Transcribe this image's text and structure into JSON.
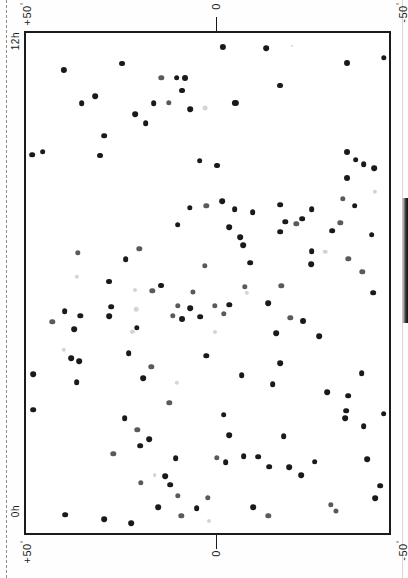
{
  "document": {
    "type": "scanned-figure-page",
    "caption_fragment": "",
    "orientation": "rotated-90"
  },
  "axes": {
    "top_left_label": "+50",
    "top_left_corner_label": "12h",
    "top_center_label": "0",
    "top_right_label": "-50",
    "bottom_left_corner_label": "0h",
    "bottom_left_label": "+50",
    "bottom_center_label": "0",
    "bottom_right_label": "-50",
    "degree_symbol": "°"
  },
  "colors": {
    "frame": "#1b1b1b",
    "point_dark": "#1a1a1a",
    "point_mid": "#5a5a5a",
    "point_light": "#a8a8a8",
    "point_faint": "#d4d4d4",
    "margin_rule": "#8f8f8f",
    "background": "#ffffff"
  },
  "chart_data": {
    "type": "scatter",
    "title": "",
    "xlabel": "Right Ascension",
    "ylabel": "Declination",
    "xlim": [
      0,
      1
    ],
    "ylim": [
      0,
      1
    ],
    "grid": false,
    "legend": null,
    "note": "Sky-distribution scatter plot; page printed rotated 90 degrees. Axis ticks marked at 0 (top and bottom centre); corner labels 12h / 0h and +50/-50 degrees.",
    "x_axis_ticks": [
      "+50",
      "0",
      "-50"
    ],
    "y_axis_ticks": [
      "12h",
      "0h"
    ],
    "point_count": 151,
    "points": [
      [
        0.543,
        0.028,
        "dark",
        4.6
      ],
      [
        0.662,
        0.03,
        "dark",
        4.2
      ],
      [
        0.733,
        0.026,
        "faint",
        1.6
      ],
      [
        0.105,
        0.073,
        "dark",
        4.6
      ],
      [
        0.885,
        0.06,
        "dark",
        4.4
      ],
      [
        0.985,
        0.05,
        "dark",
        4.0
      ],
      [
        0.265,
        0.061,
        "dark",
        4.4
      ],
      [
        0.415,
        0.089,
        "dark",
        4.2
      ],
      [
        0.373,
        0.09,
        "mid",
        4.0
      ],
      [
        0.437,
        0.09,
        "dark",
        4.4
      ],
      [
        0.43,
        0.115,
        "dark",
        4.4
      ],
      [
        0.7,
        0.105,
        "dark",
        4.4
      ],
      [
        0.19,
        0.126,
        "dark",
        4.2
      ],
      [
        0.153,
        0.141,
        "dark",
        4.2
      ],
      [
        0.352,
        0.14,
        "dark",
        4.2
      ],
      [
        0.393,
        0.139,
        "mid",
        4.0
      ],
      [
        0.452,
        0.152,
        "dark",
        4.2
      ],
      [
        0.493,
        0.15,
        "faint",
        3.6
      ],
      [
        0.577,
        0.139,
        "dark",
        4.6
      ],
      [
        0.3,
        0.163,
        "dark",
        4.2
      ],
      [
        0.33,
        0.18,
        "dark",
        4.2
      ],
      [
        0.215,
        0.205,
        "dark",
        4.2
      ],
      [
        0.017,
        0.243,
        "dark",
        4.2
      ],
      [
        0.046,
        0.237,
        "dark",
        4.2
      ],
      [
        0.205,
        0.245,
        "dark",
        4.4
      ],
      [
        0.885,
        0.238,
        "dark",
        4.4
      ],
      [
        0.93,
        0.262,
        "dark",
        4.2
      ],
      [
        0.908,
        0.253,
        "dark",
        4.2
      ],
      [
        0.96,
        0.27,
        "dark",
        4.2
      ],
      [
        0.478,
        0.255,
        "dark",
        4.2
      ],
      [
        0.525,
        0.265,
        "dark",
        4.4
      ],
      [
        0.885,
        0.29,
        "dark",
        4.4
      ],
      [
        0.497,
        0.345,
        "mid",
        4.0
      ],
      [
        0.541,
        0.336,
        "dark",
        4.2
      ],
      [
        0.452,
        0.35,
        "dark",
        4.0
      ],
      [
        0.575,
        0.352,
        "dark",
        4.2
      ],
      [
        0.624,
        0.358,
        "dark",
        4.2
      ],
      [
        0.7,
        0.343,
        "dark",
        4.2
      ],
      [
        0.787,
        0.352,
        "dark",
        4.2
      ],
      [
        0.872,
        0.331,
        "mid",
        4.0
      ],
      [
        0.905,
        0.345,
        "dark",
        4.2
      ],
      [
        0.961,
        0.318,
        "faint",
        3.2
      ],
      [
        0.418,
        0.383,
        "dark",
        4.2
      ],
      [
        0.56,
        0.388,
        "dark",
        4.2
      ],
      [
        0.714,
        0.378,
        "dark",
        4.0
      ],
      [
        0.745,
        0.382,
        "mid",
        4.0
      ],
      [
        0.7,
        0.397,
        "dark",
        4.2
      ],
      [
        0.76,
        0.371,
        "dark",
        4.2
      ],
      [
        0.866,
        0.379,
        "mid",
        4.0
      ],
      [
        0.59,
        0.408,
        "dark",
        4.2
      ],
      [
        0.598,
        0.424,
        "dark",
        4.2
      ],
      [
        0.952,
        0.403,
        "dark",
        4.2
      ],
      [
        0.843,
        0.395,
        "dark",
        4.2
      ],
      [
        0.143,
        0.439,
        "mid",
        4.0
      ],
      [
        0.275,
        0.452,
        "dark",
        4.2
      ],
      [
        0.312,
        0.432,
        "mid",
        4.0
      ],
      [
        0.787,
        0.436,
        "dark",
        4.2
      ],
      [
        0.824,
        0.437,
        "faint",
        3.4
      ],
      [
        0.618,
        0.459,
        "dark",
        4.2
      ],
      [
        0.492,
        0.466,
        "mid",
        4.0
      ],
      [
        0.785,
        0.462,
        "dark",
        4.2
      ],
      [
        0.888,
        0.452,
        "mid",
        4.0
      ],
      [
        0.14,
        0.488,
        "faint",
        3.2
      ],
      [
        0.23,
        0.497,
        "dark",
        4.4
      ],
      [
        0.926,
        0.478,
        "mid",
        4.0
      ],
      [
        0.372,
        0.505,
        "dark",
        4.4
      ],
      [
        0.348,
        0.516,
        "mid",
        4.0
      ],
      [
        0.46,
        0.517,
        "mid",
        3.8
      ],
      [
        0.3,
        0.514,
        "faint",
        3.0
      ],
      [
        0.603,
        0.508,
        "mid",
        4.0
      ],
      [
        0.608,
        0.52,
        "faint",
        3.2
      ],
      [
        0.703,
        0.506,
        "mid",
        4.0
      ],
      [
        0.957,
        0.519,
        "dark",
        4.2
      ],
      [
        0.235,
        0.547,
        "dark",
        4.2
      ],
      [
        0.303,
        0.552,
        "faint",
        3.4
      ],
      [
        0.418,
        0.545,
        "mid",
        4.0
      ],
      [
        0.452,
        0.55,
        "dark",
        4.2
      ],
      [
        0.52,
        0.545,
        "mid",
        4.0
      ],
      [
        0.56,
        0.543,
        "dark",
        4.0
      ],
      [
        0.668,
        0.54,
        "dark",
        4.2
      ],
      [
        0.23,
        0.566,
        "dark",
        4.2
      ],
      [
        0.15,
        0.565,
        "dark",
        4.0
      ],
      [
        0.405,
        0.565,
        "mid",
        4.0
      ],
      [
        0.43,
        0.572,
        "dark",
        4.4
      ],
      [
        0.48,
        0.567,
        "dark",
        4.2
      ],
      [
        0.545,
        0.562,
        "mid",
        4.0
      ],
      [
        0.728,
        0.57,
        "mid",
        4.0
      ],
      [
        0.762,
        0.576,
        "dark",
        4.4
      ],
      [
        0.107,
        0.556,
        "dark",
        4.2
      ],
      [
        0.305,
        0.59,
        "dark",
        4.0
      ],
      [
        0.293,
        0.597,
        "faint",
        3.2
      ],
      [
        0.52,
        0.598,
        "faint",
        3.0
      ],
      [
        0.69,
        0.6,
        "dark",
        4.2
      ],
      [
        0.808,
        0.606,
        "dark",
        4.2
      ],
      [
        0.072,
        0.578,
        "mid",
        4.0
      ],
      [
        0.133,
        0.592,
        "dark",
        4.2
      ],
      [
        0.105,
        0.633,
        "faint",
        3.2
      ],
      [
        0.124,
        0.65,
        "dark",
        4.2
      ],
      [
        0.147,
        0.656,
        "dark",
        4.2
      ],
      [
        0.283,
        0.64,
        "dark",
        4.2
      ],
      [
        0.497,
        0.646,
        "dark",
        4.0
      ],
      [
        0.345,
        0.668,
        "mid",
        4.0
      ],
      [
        0.7,
        0.66,
        "dark",
        4.2
      ],
      [
        0.02,
        0.682,
        "dark",
        4.2
      ],
      [
        0.14,
        0.698,
        "dark",
        4.2
      ],
      [
        0.322,
        0.69,
        "dark",
        4.2
      ],
      [
        0.415,
        0.7,
        "faint",
        3.2
      ],
      [
        0.594,
        0.684,
        "dark",
        4.2
      ],
      [
        0.68,
        0.702,
        "dark",
        4.2
      ],
      [
        0.925,
        0.68,
        "dark",
        4.2
      ],
      [
        0.83,
        0.718,
        "dark",
        4.2
      ],
      [
        0.887,
        0.725,
        "dark",
        4.2
      ],
      [
        0.02,
        0.753,
        "dark",
        4.2
      ],
      [
        0.395,
        0.74,
        "mid",
        4.0
      ],
      [
        0.882,
        0.755,
        "dark",
        4.2
      ],
      [
        0.985,
        0.761,
        "dark",
        4.2
      ],
      [
        0.88,
        0.77,
        "dark",
        4.2
      ],
      [
        0.272,
        0.77,
        "dark",
        4.2
      ],
      [
        0.545,
        0.763,
        "dark",
        4.2
      ],
      [
        0.93,
        0.786,
        "dark",
        4.2
      ],
      [
        0.307,
        0.794,
        "mid",
        4.0
      ],
      [
        0.34,
        0.812,
        "dark",
        4.2
      ],
      [
        0.315,
        0.825,
        "dark",
        4.2
      ],
      [
        0.56,
        0.804,
        "dark",
        4.2
      ],
      [
        0.71,
        0.806,
        "dark",
        4.2
      ],
      [
        0.24,
        0.842,
        "mid",
        4.0
      ],
      [
        0.525,
        0.85,
        "mid",
        4.0
      ],
      [
        0.55,
        0.858,
        "dark",
        4.2
      ],
      [
        0.6,
        0.846,
        "dark",
        4.2
      ],
      [
        0.64,
        0.847,
        "dark",
        4.2
      ],
      [
        0.67,
        0.867,
        "dark",
        4.2
      ],
      [
        0.412,
        0.85,
        "dark",
        4.2
      ],
      [
        0.795,
        0.857,
        "dark",
        4.2
      ],
      [
        0.725,
        0.868,
        "dark",
        4.2
      ],
      [
        0.94,
        0.852,
        "dark",
        4.2
      ],
      [
        0.758,
        0.884,
        "dark",
        4.2
      ],
      [
        0.354,
        0.884,
        "faint",
        2.8
      ],
      [
        0.383,
        0.886,
        "dark",
        4.2
      ],
      [
        0.317,
        0.9,
        "mid",
        4.0
      ],
      [
        0.397,
        0.903,
        "dark",
        4.2
      ],
      [
        0.975,
        0.905,
        "dark",
        4.2
      ],
      [
        0.418,
        0.925,
        "mid",
        4.0
      ],
      [
        0.5,
        0.93,
        "mid",
        4.0
      ],
      [
        0.47,
        0.95,
        "dark",
        4.2
      ],
      [
        0.365,
        0.948,
        "dark",
        4.2
      ],
      [
        0.625,
        0.948,
        "dark",
        4.2
      ],
      [
        0.84,
        0.944,
        "mid",
        4.0
      ],
      [
        0.855,
        0.955,
        "mid",
        3.8
      ],
      [
        0.428,
        0.965,
        "mid",
        4.0
      ],
      [
        0.668,
        0.965,
        "mid",
        4.0
      ],
      [
        0.505,
        0.975,
        "faint",
        3.0
      ],
      [
        0.215,
        0.972,
        "dark",
        4.2
      ],
      [
        0.29,
        0.98,
        "dark",
        4.2
      ],
      [
        0.108,
        0.963,
        "dark",
        4.2
      ],
      [
        0.962,
        0.93,
        "dark",
        4.2
      ]
    ]
  }
}
